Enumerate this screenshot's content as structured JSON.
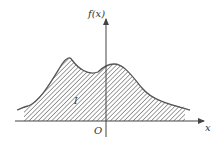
{
  "figure": {
    "y_axis_label": "f(x)",
    "x_axis_label": "x",
    "origin_label": "O",
    "region_label": "I",
    "colors": {
      "stroke": "#555555",
      "hatch": "#777777",
      "background": "#ffffff",
      "text": "#333333"
    }
  }
}
